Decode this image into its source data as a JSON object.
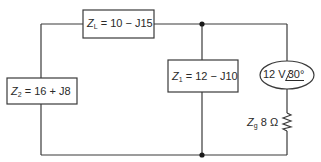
{
  "diagram": {
    "type": "ac-circuit",
    "components": {
      "load_impedance": {
        "symbol": "Z",
        "subscript": "L",
        "value": "10 − J15"
      },
      "z1": {
        "symbol": "Z",
        "subscript": "1",
        "value": "12 − J10"
      },
      "z2": {
        "symbol": "Z",
        "subscript": "2",
        "value": "16 + J8"
      },
      "source": {
        "magnitude": "12 V",
        "angle": "30°"
      },
      "source_impedance": {
        "symbol": "Z",
        "subscript": "g",
        "value": "8 Ω"
      }
    },
    "colors": {
      "line": "#3a3a3a",
      "background": "#ffffff"
    }
  }
}
